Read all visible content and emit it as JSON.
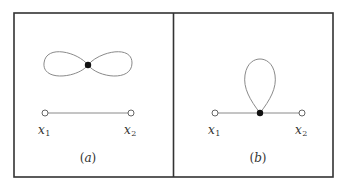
{
  "figure": {
    "panels": [
      {
        "id": "a",
        "caption": "(a)",
        "caption_letter": "a",
        "points": [
          {
            "label": "x",
            "subscript": "1",
            "type": "open"
          },
          {
            "label": "x",
            "subscript": "2",
            "type": "open"
          }
        ],
        "description": "Figure-eight loop with filled vertex, separate from segment joining x1 and x2"
      },
      {
        "id": "b",
        "caption": "(b)",
        "caption_letter": "b",
        "points": [
          {
            "label": "x",
            "subscript": "1",
            "type": "open"
          },
          {
            "label": "x",
            "subscript": "2",
            "type": "open"
          }
        ],
        "description": "Segment from x1 to x2 with a filled vertex carrying a single loop"
      }
    ]
  }
}
